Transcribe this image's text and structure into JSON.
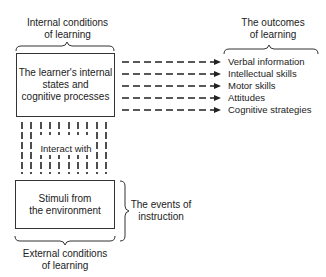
{
  "diagram": {
    "internal_conditions_label": [
      "Internal conditions",
      "of learning"
    ],
    "learner_box": [
      "The learner's internal",
      "states and",
      "cognitive processes"
    ],
    "interact_label": "Interact with",
    "stimuli_box": [
      "Stimuli from",
      "the environment"
    ],
    "events_label": [
      "The events of",
      "instruction"
    ],
    "external_conditions_label": [
      "External conditions",
      "of learning"
    ],
    "outcomes_label": [
      "The outcomes",
      "of learning"
    ],
    "outcomes": [
      "Verbal information",
      "Intellectual skills",
      "Motor skills",
      "Attitudes",
      "Cognitive strategies"
    ]
  }
}
